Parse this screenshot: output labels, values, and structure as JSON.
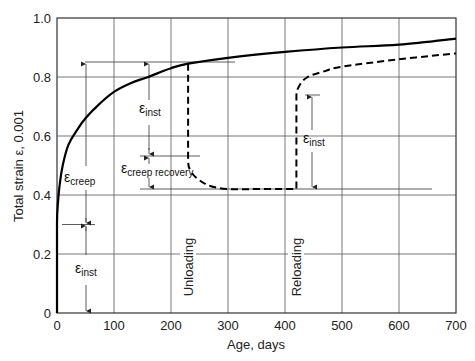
{
  "chart_data": {
    "type": "line",
    "title": "",
    "xlabel": "Age, days",
    "ylabel": "Total strain ε, 0.001",
    "xlim": [
      0,
      700
    ],
    "ylim": [
      0,
      1.0
    ],
    "grid": true,
    "legend": null,
    "x_ticks": [
      "0",
      "100",
      "200",
      "300",
      "400",
      "500",
      "600",
      "700"
    ],
    "y_ticks": [
      "0",
      "0.2",
      "0.4",
      "0.6",
      "0.8",
      "1.0"
    ],
    "series": [
      {
        "name": "Sustained load (solid)",
        "style": "solid",
        "x": [
          0,
          2,
          5,
          10,
          20,
          35,
          50,
          75,
          100,
          130,
          160,
          200,
          230,
          300,
          400,
          500,
          600,
          700
        ],
        "y": [
          0.3,
          0.38,
          0.44,
          0.5,
          0.57,
          0.62,
          0.66,
          0.71,
          0.75,
          0.78,
          0.8,
          0.83,
          0.845,
          0.865,
          0.885,
          0.9,
          0.91,
          0.93
        ]
      },
      {
        "name": "Unloading / reloading (dashed)",
        "style": "dashed",
        "x": [
          230,
          230,
          235,
          250,
          270,
          300,
          350,
          420,
          420,
          425,
          440,
          470,
          500,
          600,
          700
        ],
        "y": [
          0.845,
          0.52,
          0.48,
          0.45,
          0.43,
          0.42,
          0.42,
          0.42,
          0.73,
          0.77,
          0.8,
          0.82,
          0.835,
          0.86,
          0.88
        ]
      }
    ],
    "annotations": [
      {
        "text_main": "ε",
        "text_sub": "inst",
        "position": "x≈50, between 0 and 0.30"
      },
      {
        "text_main": "ε",
        "text_sub": "creep",
        "position": "x≈50, between 0.30 and 0.85"
      },
      {
        "text_main": "ε",
        "text_sub": "inst",
        "position": "x≈150, between 0.53 and 0.85"
      },
      {
        "text_main": "ε",
        "text_sub": "creep recovery",
        "position": "x≈150, between 0.42 and 0.53"
      },
      {
        "text_main": "ε",
        "text_sub": "inst",
        "position": "x≈450, between 0.42 and 0.74"
      },
      {
        "text": "Unloading",
        "position": "vertical at x≈230"
      },
      {
        "text": "Reloading",
        "position": "vertical at x≈420"
      }
    ]
  },
  "labels": {
    "xlabel": "Age, days",
    "ylabel": "Total strain ε, 0.001",
    "unloading": "Unloading",
    "reloading": "Reloading",
    "eps": "ε",
    "sub_inst": "inst",
    "sub_creep": "creep",
    "sub_creep_recovery": "creep recovery"
  },
  "ticks": {
    "x": [
      "0",
      "100",
      "200",
      "300",
      "400",
      "500",
      "600",
      "700"
    ],
    "y": [
      "0",
      "0.2",
      "0.4",
      "0.6",
      "0.8",
      "1.0"
    ]
  }
}
